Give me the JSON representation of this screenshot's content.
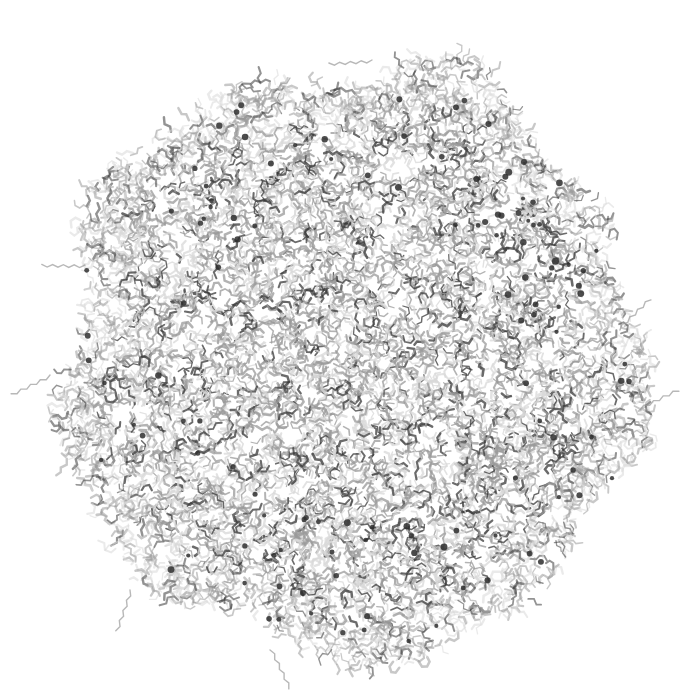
{
  "image": {
    "subject": "molecular structure stick rendering",
    "width": 700,
    "height": 692,
    "background": "#ffffff"
  },
  "molecule": {
    "center": [
      352,
      362
    ],
    "radius_x": 285,
    "radius_y": 290,
    "stick_color_light": "#d8d8d8",
    "stick_color_mid": "#9a9a9a",
    "stick_color_dark": "#3a3a3a",
    "atom_color_dark": "#2e2e2e",
    "seed": 7,
    "bond_count": 9000,
    "dark_atom_count": 120,
    "protrusions": [
      {
        "x": 372,
        "y": 60,
        "dx": -30,
        "dy": -12
      },
      {
        "x": 290,
        "y": 78,
        "dx": -40,
        "dy": 5
      },
      {
        "x": 640,
        "y": 410,
        "dx": 20,
        "dy": 0
      },
      {
        "x": 620,
        "y": 330,
        "dx": 15,
        "dy": -5
      },
      {
        "x": 130,
        "y": 590,
        "dx": -15,
        "dy": 15
      },
      {
        "x": 270,
        "y": 650,
        "dx": 0,
        "dy": 15
      },
      {
        "x": 50,
        "y": 375,
        "dx": -10,
        "dy": 0
      },
      {
        "x": 85,
        "y": 265,
        "dx": -10,
        "dy": -5
      }
    ]
  }
}
